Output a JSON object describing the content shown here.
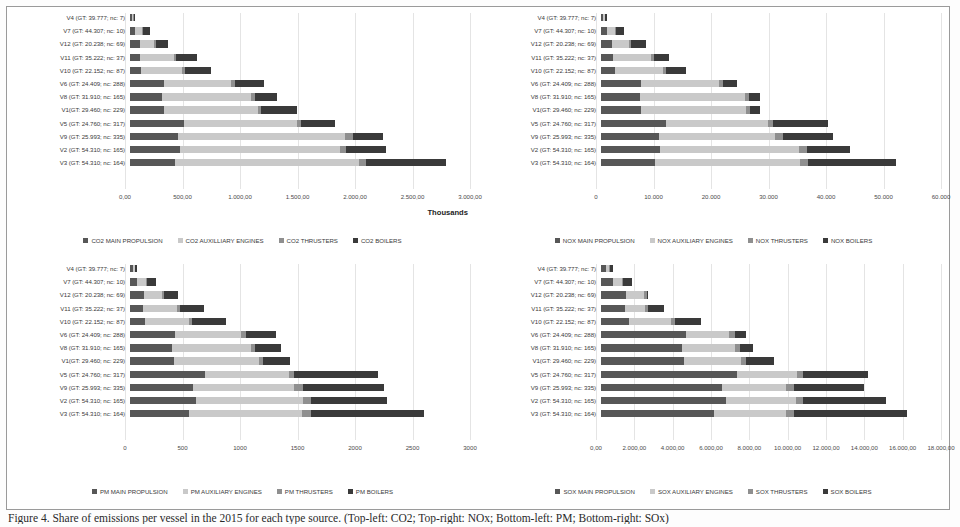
{
  "figure": {
    "caption": "Figure 4. Share of emissions per vessel in the 2015 for each type source. (Top-left: CO2; Top-right: NOx; Bottom-left: PM; Bottom-right: SOx)",
    "categories": [
      "V4 (GT: 39.777; nc: 7)",
      "V7 (GT: 44.307; nc: 10)",
      "V12 (GT: 20.238; nc: 69)",
      "V11 (GT: 35.222; nc: 37)",
      "V10 (GT: 22.152; nc: 87)",
      "V6 (GT: 24.409; nc: 288)",
      "V8 (GT: 31.910; nc: 165)",
      "V1(GT: 29.460; nc: 229)",
      "V5 (GT: 24.760; nc: 317)",
      "V9 (GT: 25.993; nc: 335)",
      "V2 (GT: 54.310; nc: 165)",
      "V3 (GT: 54.310; nc: 164)"
    ],
    "colors": {
      "main_propulsion": "#575757",
      "auxiliary_engines": "#c9c9c9",
      "thrusters": "#8f8f8f",
      "boilers": "#3a3a3a"
    }
  },
  "chart_data": [
    {
      "id": "co2",
      "type": "bar",
      "orientation": "horizontal",
      "stacked": true,
      "title": "",
      "xlabel": "Thousands",
      "ylabel": "",
      "xlim": [
        0,
        3000
      ],
      "grid": true,
      "legend_position": "bottom",
      "tick_labels": [
        "0,00",
        "500,00",
        "1.000,00",
        "1.500,00",
        "2.000,00",
        "2.500,00",
        "3.000,00"
      ],
      "tick_values": [
        0,
        500,
        1000,
        1500,
        2000,
        2500,
        3000
      ],
      "categories": [
        "V4 (GT: 39.777; nc: 7)",
        "V7 (GT: 44.307; nc: 10)",
        "V12 (GT: 20.238; nc: 69)",
        "V11 (GT: 35.222; nc: 37)",
        "V10 (GT: 22.152; nc: 87)",
        "V6 (GT: 24.409; nc: 288)",
        "V8 (GT: 31.910; nc: 165)",
        "V1(GT: 29.460; nc: 229)",
        "V5 (GT: 24.760; nc: 317)",
        "V9 (GT: 25.993; nc: 335)",
        "V2 (GT: 54.310; nc: 165)",
        "V3 (GT: 54.310; nc: 164)"
      ],
      "series": [
        {
          "name": "CO2 MAIN PROPULSION",
          "values": [
            18,
            48,
            85,
            90,
            100,
            300,
            285,
            300,
            480,
            420,
            440,
            400
          ]
        },
        {
          "name": "CO2 AUXILLIARY ENGINES",
          "values": [
            12,
            60,
            130,
            295,
            360,
            595,
            785,
            830,
            990,
            1480,
            1410,
            1620
          ]
        },
        {
          "name": "CO2 THRUSTERS",
          "values": [
            2,
            8,
            12,
            18,
            22,
            35,
            30,
            30,
            40,
            65,
            60,
            65
          ]
        },
        {
          "name": "CO2 BOILERS",
          "values": [
            10,
            60,
            110,
            185,
            230,
            250,
            195,
            310,
            300,
            270,
            345,
            700
          ]
        }
      ]
    },
    {
      "id": "nox",
      "type": "bar",
      "orientation": "horizontal",
      "stacked": true,
      "title": "",
      "xlabel": "",
      "ylabel": "",
      "xlim": [
        0,
        60000
      ],
      "grid": true,
      "legend_position": "bottom",
      "tick_labels": [
        "0",
        "10.000",
        "20.000",
        "30.000",
        "40.000",
        "50.000",
        "60.000"
      ],
      "tick_values": [
        0,
        10000,
        20000,
        30000,
        40000,
        50000,
        60000
      ],
      "categories": [
        "V4 (GT: 39.777; nc: 7)",
        "V7 (GT: 44.307; nc: 10)",
        "V12 (GT: 20.238; nc: 69)",
        "V11 (GT: 35.222; nc: 37)",
        "V10 (GT: 22.152; nc: 87)",
        "V6 (GT: 24.409; nc: 288)",
        "V8 (GT: 31.910; nc: 165)",
        "V1(GT: 29.460; nc: 229)",
        "V5 (GT: 24.760; nc: 317)",
        "V9 (GT: 25.993; nc: 335)",
        "V2 (GT: 54.310; nc: 165)",
        "V3 (GT: 54.310; nc: 164)"
      ],
      "series": [
        {
          "name": "NOX MAIN PROPULSION",
          "values": [
            400,
            1100,
            2000,
            2100,
            2400,
            7000,
            6800,
            7000,
            11500,
            10200,
            10500,
            9600
          ]
        },
        {
          "name": "NOX AUXILIARY ENGINES",
          "values": [
            300,
            1300,
            3000,
            6800,
            8500,
            13800,
            18600,
            18600,
            18000,
            20500,
            24500,
            25500
          ]
        },
        {
          "name": "NOX THRUSTERS",
          "values": [
            50,
            200,
            300,
            400,
            500,
            800,
            700,
            700,
            900,
            1400,
            1300,
            1400
          ]
        },
        {
          "name": "NOX BOILERS",
          "values": [
            250,
            1400,
            2700,
            2700,
            3600,
            2400,
            1900,
            1700,
            9600,
            8900,
            7700,
            15500
          ]
        }
      ]
    },
    {
      "id": "pm",
      "type": "bar",
      "orientation": "horizontal",
      "stacked": true,
      "title": "",
      "xlabel": "",
      "ylabel": "",
      "xlim": [
        0,
        3000
      ],
      "grid": true,
      "legend_position": "bottom",
      "tick_labels": [
        "0",
        "500",
        "1000",
        "1500",
        "2000",
        "2500",
        "3000"
      ],
      "tick_values": [
        0,
        500,
        1000,
        1500,
        2000,
        2500,
        3000
      ],
      "categories": [
        "V4 (GT: 39.777; nc: 7)",
        "V7 (GT: 44.307; nc: 10)",
        "V12 (GT: 20.238; nc: 69)",
        "V11 (GT: 35.222; nc: 37)",
        "V10 (GT: 22.152; nc: 87)",
        "V6 (GT: 24.409; nc: 288)",
        "V8 (GT: 31.910; nc: 165)",
        "V1(GT: 29.460; nc: 229)",
        "V5 (GT: 24.760; nc: 317)",
        "V9 (GT: 25.993; nc: 335)",
        "V2 (GT: 54.310; nc: 165)",
        "V3 (GT: 54.310; nc: 164)"
      ],
      "series": [
        {
          "name": "PM MAIN PROPULSION",
          "values": [
            25,
            65,
            120,
            115,
            135,
            400,
            375,
            390,
            660,
            560,
            580,
            520
          ]
        },
        {
          "name": "PM AUXILIARY ENGINES",
          "values": [
            18,
            75,
            160,
            300,
            385,
            580,
            690,
            745,
            740,
            890,
            950,
            1000
          ]
        },
        {
          "name": "PM THRUSTERS",
          "values": [
            4,
            12,
            18,
            25,
            30,
            45,
            40,
            40,
            50,
            75,
            70,
            75
          ]
        },
        {
          "name": "PM BOILERS",
          "values": [
            15,
            80,
            130,
            210,
            295,
            260,
            230,
            240,
            740,
            720,
            670,
            1000
          ]
        }
      ]
    },
    {
      "id": "sox",
      "type": "bar",
      "orientation": "horizontal",
      "stacked": true,
      "title": "",
      "xlabel": "",
      "ylabel": "",
      "xlim": [
        0,
        18000
      ],
      "grid": true,
      "legend_position": "bottom",
      "tick_labels": [
        "0,00",
        "2.000,00",
        "4.000,00",
        "6.000,00",
        "8.000,00",
        "10.000,00",
        "12.000,00",
        "14.000,00",
        "16.000,00",
        "18.000,00"
      ],
      "tick_values": [
        0,
        2000,
        4000,
        6000,
        8000,
        10000,
        12000,
        14000,
        16000,
        18000
      ],
      "categories": [
        "V4 (GT: 39.777; nc: 7)",
        "V7 (GT: 44.307; nc: 10)",
        "V12 (GT: 20.238; nc: 69)",
        "V11 (GT: 35.222; nc: 37)",
        "V10 (GT: 22.152; nc: 87)",
        "V6 (GT: 24.409; nc: 288)",
        "V8 (GT: 31.910; nc: 165)",
        "V1(GT: 29.460; nc: 229)",
        "V5 (GT: 24.760; nc: 317)",
        "V9 (GT: 25.993; nc: 335)",
        "V2 (GT: 54.310; nc: 165)",
        "V3 (GT: 54.310; nc: 164)"
      ],
      "series": [
        {
          "name": "SOX MAIN PROPULSION",
          "values": [
            260,
            620,
            1300,
            1250,
            1500,
            4500,
            4300,
            4400,
            7200,
            6400,
            6600,
            6000
          ]
        },
        {
          "name": "SOX AUXILIARY ENGINES",
          "values": [
            180,
            480,
            1000,
            1100,
            2200,
            2300,
            2800,
            3000,
            3200,
            3400,
            3700,
            3800
          ]
        },
        {
          "name": "SOX THRUSTERS",
          "values": [
            40,
            90,
            120,
            160,
            200,
            300,
            250,
            260,
            320,
            400,
            380,
            400
          ]
        },
        {
          "name": "SOX BOILERS",
          "values": [
            150,
            450,
            80,
            850,
            1400,
            600,
            700,
            1500,
            3400,
            3700,
            4400,
            6000
          ]
        }
      ]
    }
  ],
  "legends": [
    {
      "items": [
        "CO2 MAIN PROPULSION",
        "CO2 AUXILLIARY ENGINES",
        "CO2 THRUSTERS",
        "CO2 BOILERS"
      ]
    },
    {
      "items": [
        "NOX MAIN PROPULSION",
        "NOX AUXILIARY ENGINES",
        "NOX THRUSTERS",
        "NOX BOILERS"
      ]
    },
    {
      "items": [
        "PM MAIN PROPULSION",
        "PM AUXILIARY ENGINES",
        "PM THRUSTERS",
        "PM BOILERS"
      ]
    },
    {
      "items": [
        "SOX MAIN PROPULSION",
        "SOX AUXILIARY ENGINES",
        "SOX THRUSTERS",
        "SOX BOILERS"
      ]
    }
  ]
}
